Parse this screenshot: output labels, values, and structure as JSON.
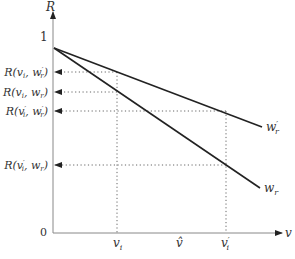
{
  "diagram": {
    "axes": {
      "y_label": "R",
      "x_label": "v",
      "y_tick_top": "1",
      "origin": "0"
    },
    "y_levels": [
      {
        "label_main": "R(v",
        "sub1": "i",
        "mid": ", w",
        "sup2": "′",
        "sub2": "r",
        "end": ")",
        "y": 72,
        "x_end": 117
      },
      {
        "label_main": "R(v",
        "sub1": "i",
        "mid": ", w",
        "sup2": "",
        "sub2": "r",
        "end": ")",
        "y": 92,
        "x_end": 117
      },
      {
        "label_main": "R(v",
        "sub1": "i",
        "sup1": "′",
        "mid": ", w",
        "sup2": "′",
        "sub2": "r",
        "end": ")",
        "y": 111,
        "x_end": 226
      },
      {
        "label_main": "R(v",
        "sub1": "i",
        "sup1": "′",
        "mid": ", w",
        "sup2": "",
        "sub2": "r",
        "end": ")",
        "y": 165,
        "x_end": 226
      }
    ],
    "x_ticks": [
      {
        "label": "v",
        "sub": "i",
        "sup": "",
        "x": 117
      },
      {
        "label": "v̂",
        "sub": "",
        "sup": "",
        "x": 180
      },
      {
        "label": "v",
        "sub": "i",
        "sup": "′",
        "x": 226
      }
    ],
    "lines": [
      {
        "name": "w_r_prime",
        "label": "w",
        "sub": "r",
        "sup": "′",
        "x1": 54,
        "y1": 48,
        "x2": 262,
        "y2": 127
      },
      {
        "name": "w_r",
        "label": "w",
        "sub": "r",
        "sup": "",
        "x1": 54,
        "y1": 48,
        "x2": 260,
        "y2": 188
      }
    ],
    "colors": {
      "line": "#222222",
      "axis": "#444444",
      "dotted": "#555555"
    }
  }
}
